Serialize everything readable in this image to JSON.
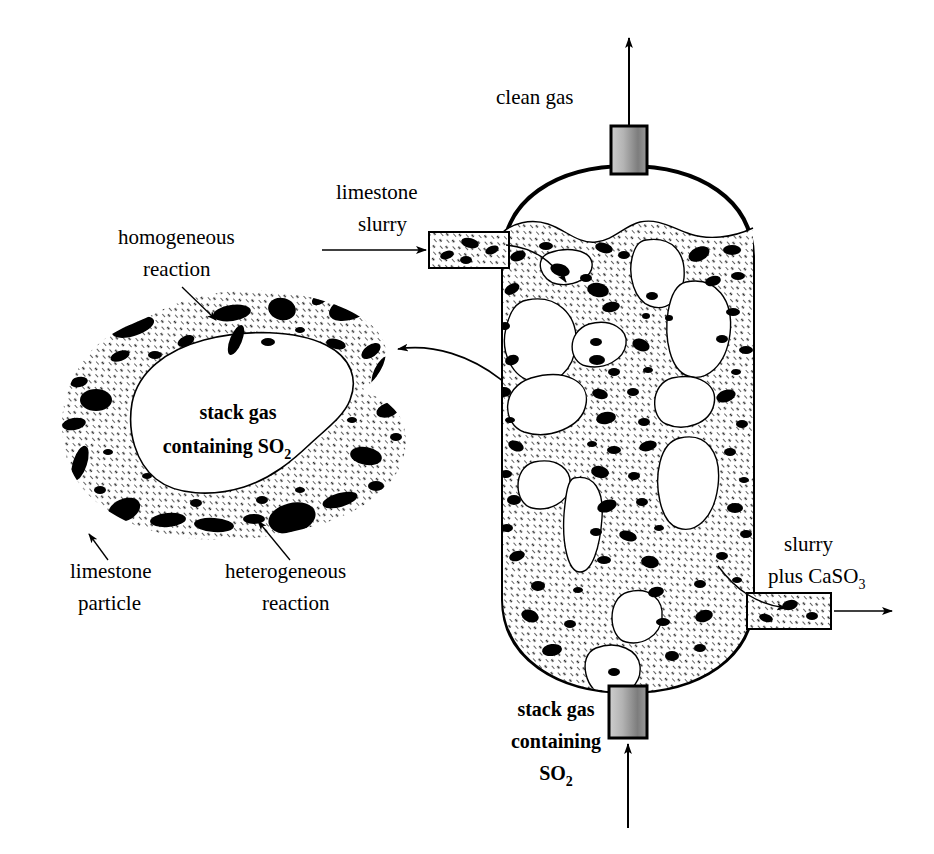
{
  "figure": {
    "type": "process-flow-diagram"
  },
  "colors": {
    "line": "#000000",
    "background": "#ffffff",
    "hatch": "#3a3a3a",
    "particle": "#000000",
    "nozzle_light": "#d8d8d8",
    "nozzle_dark": "#6e6e6e"
  },
  "vessel": {
    "name": "scrubber-vessel",
    "top_outlet_label_line1": "clean gas",
    "bottom_inlet_label_line1": "stack gas",
    "bottom_inlet_label_line2": "containing",
    "bottom_inlet_label_line3": "SO",
    "bottom_inlet_label_sub3": "2",
    "left_inlet_label_line1": "limestone",
    "left_inlet_label_line2": "slurry",
    "right_outlet_label_line1": "slurry",
    "right_outlet_label_line2": "plus CaSO",
    "right_outlet_label_sub2": "3"
  },
  "detail_bubble": {
    "name": "magnified-bubble-detail",
    "center_label_line1": "stack gas",
    "center_label_line2": "containing SO",
    "center_label_sub2": "2",
    "callout_top_line1": "homogeneous",
    "callout_top_line2": "reaction",
    "callout_bottom_left_line1": "limestone",
    "callout_bottom_left_line2": "particle",
    "callout_bottom_right_line1": "heterogeneous",
    "callout_bottom_right_line2": "reaction"
  }
}
